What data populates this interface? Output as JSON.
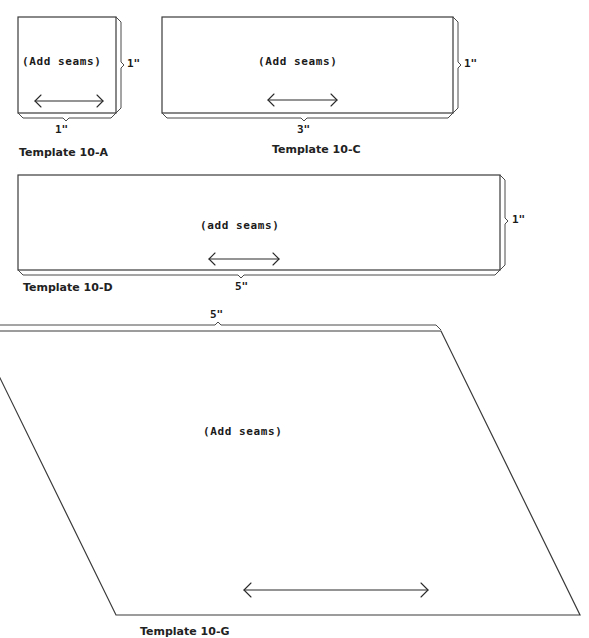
{
  "colors": {
    "background": "#ffffff",
    "line": "#3a3a3a",
    "text": "#1a1a1a"
  },
  "templates": [
    {
      "id": "10-A",
      "label": "Template 10-A",
      "seam_note": "(Add seams)",
      "width_dim": "1\"",
      "height_dim": "1\"",
      "shape": "square",
      "grain_direction": "horizontal"
    },
    {
      "id": "10-C",
      "label": "Template 10-C",
      "seam_note": "(Add seams)",
      "width_dim": "3\"",
      "height_dim": "1\"",
      "shape": "rectangle",
      "grain_direction": "horizontal"
    },
    {
      "id": "10-D",
      "label": "Template 10-D",
      "seam_note": "(add seams)",
      "width_dim": "5\"",
      "height_dim": "1\"",
      "shape": "rectangle",
      "grain_direction": "horizontal"
    },
    {
      "id": "10-G",
      "label": "Template 10-G",
      "seam_note": "(Add seams)",
      "width_dim": "5\"",
      "shape": "parallelogram",
      "grain_direction": "horizontal"
    }
  ]
}
